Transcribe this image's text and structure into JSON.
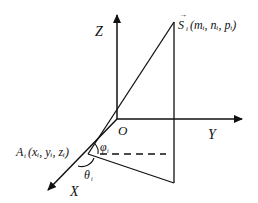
{
  "diagram": {
    "type": "3d-coordinate-geometry",
    "axes": {
      "z_label": "Z",
      "y_label": "Y",
      "x_label": "X",
      "origin_label": "O"
    },
    "points": {
      "S": {
        "label": "S",
        "accent": "→",
        "subscript": "i",
        "coords": "(m, n, p)",
        "coord_text": "(mᵢ, nᵢ, pᵢ)"
      },
      "A": {
        "label": "A",
        "subscript": "i",
        "coord_text": "(xᵢ, yᵢ, zᵢ)"
      }
    },
    "angles": {
      "phi": {
        "symbol": "φ",
        "subscript": "i"
      },
      "theta": {
        "symbol": "θ",
        "subscript": "i"
      }
    },
    "colors": {
      "line": "#111111",
      "background": "#ffffff"
    }
  }
}
